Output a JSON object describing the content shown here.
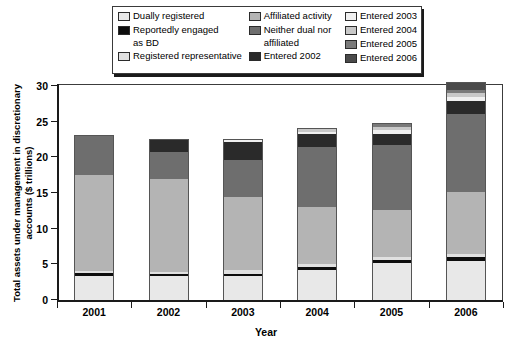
{
  "legend": {
    "columns": [
      {
        "items": [
          {
            "label": "Dually registered",
            "lines": [
              "Dually registered"
            ],
            "color": "#e8e8e8"
          },
          {
            "label": "Reportedly engaged as BD",
            "lines": [
              "Reportedly engaged",
              "as BD"
            ],
            "color": "#0d0d0d"
          },
          {
            "label": "Registered representative",
            "lines": [
              "Registered representative"
            ],
            "color": "#e0e0e0"
          }
        ]
      },
      {
        "items": [
          {
            "label": "Affiliated activity",
            "lines": [
              "Affiliated activity"
            ],
            "color": "#b4b4b4"
          },
          {
            "label": "Neither dual nor affiliated",
            "lines": [
              "Neither dual nor",
              "affiliated"
            ],
            "color": "#6e6e6e"
          },
          {
            "label": "Entered 2002",
            "lines": [
              "Entered 2002"
            ],
            "color": "#2a2a2a"
          }
        ]
      },
      {
        "items": [
          {
            "label": "Entered 2003",
            "lines": [
              "Entered 2003"
            ],
            "color": "#f0f0f0"
          },
          {
            "label": "Entered 2004",
            "lines": [
              "Entered 2004"
            ],
            "color": "#c8c8c8"
          },
          {
            "label": "Entered 2005",
            "lines": [
              "Entered 2005"
            ],
            "color": "#7a7a7a"
          },
          {
            "label": "Entered 2006",
            "lines": [
              "Entered 2006"
            ],
            "color": "#4a4a4a"
          }
        ]
      }
    ]
  },
  "chart_data": {
    "type": "bar",
    "subtype": "stacked",
    "title": "",
    "xlabel": "Year",
    "ylabel": "Total assets under management in discretionary accounts ($ trillions)",
    "categories": [
      "2001",
      "2002",
      "2003",
      "2004",
      "2005",
      "2006"
    ],
    "ylim": [
      0,
      30
    ],
    "yticks": [
      0,
      5,
      10,
      15,
      20,
      25,
      30
    ],
    "grid": false,
    "legend_position": "top",
    "series": [
      {
        "name": "Dually registered",
        "color": "#e8e8e8",
        "values": [
          3.4,
          3.3,
          3.3,
          4.2,
          5.2,
          5.5
        ]
      },
      {
        "name": "Reportedly engaged as BD",
        "color": "#0d0d0d",
        "values": [
          0.4,
          0.4,
          0.4,
          0.4,
          0.4,
          0.5
        ]
      },
      {
        "name": "Registered representative",
        "color": "#e0e0e0",
        "values": [
          0.3,
          0.3,
          0.5,
          0.5,
          0.4,
          0.4
        ]
      },
      {
        "name": "Affiliated activity",
        "color": "#b4b4b4",
        "values": [
          13.4,
          13.0,
          10.3,
          8.0,
          6.6,
          8.7
        ]
      },
      {
        "name": "Neither dual nor affiliated",
        "color": "#6e6e6e",
        "values": [
          5.5,
          3.8,
          5.1,
          8.4,
          9.1,
          11.0
        ]
      },
      {
        "name": "Entered 2002",
        "color": "#2a2a2a",
        "values": [
          0,
          1.7,
          2.6,
          1.8,
          1.6,
          1.8
        ]
      },
      {
        "name": "Entered 2003",
        "color": "#f0f0f0",
        "values": [
          0,
          0,
          0.3,
          0.3,
          0.5,
          0.5
        ]
      },
      {
        "name": "Entered 2004",
        "color": "#c8c8c8",
        "values": [
          0,
          0,
          0,
          0.4,
          0.4,
          0.6
        ]
      },
      {
        "name": "Entered 2005",
        "color": "#7a7a7a",
        "values": [
          0,
          0,
          0,
          0,
          0.5,
          0.4
        ]
      },
      {
        "name": "Entered 2006",
        "color": "#4a4a4a",
        "values": [
          0,
          0,
          0,
          0,
          0,
          1.1
        ]
      }
    ],
    "totals": [
      23.0,
      22.5,
      22.5,
      24.0,
      24.7,
      30.5
    ]
  }
}
